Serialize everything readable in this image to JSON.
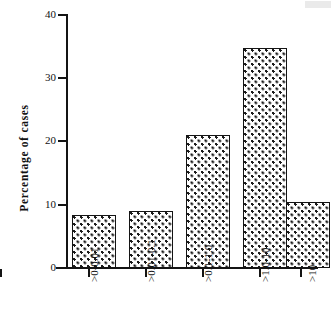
{
  "figure": {
    "background_color": "#ffffff",
    "ink_color": "#141414"
  },
  "chart_data": {
    "type": "bar",
    "title": "",
    "subtitle": "",
    "xlabel": "",
    "ylabel": "Percentage  of  cases",
    "categories": [
      ">0-0.01",
      ">0.01-0.1",
      ">0.1-1.0",
      ">1.0-10",
      ">10"
    ],
    "values": [
      8.3,
      9.0,
      21.0,
      34.6,
      10.4
    ],
    "ylim": [
      0,
      40
    ],
    "ytick_labels": [
      "0",
      "10",
      "20",
      "30",
      "40"
    ],
    "ytick_values": [
      0,
      10,
      20,
      30,
      40
    ],
    "grid": false,
    "legend": false,
    "legend_position": "none",
    "bar_fill": "stipple-dot-pattern",
    "bar_edge_color": "#141414",
    "xtick_label_rotation": 90,
    "annotations": []
  }
}
